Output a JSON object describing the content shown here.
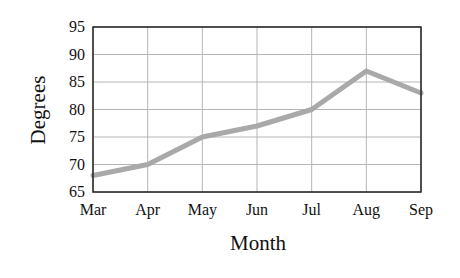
{
  "chart_data": {
    "type": "line",
    "title": "",
    "xlabel": "Month",
    "ylabel": "Degrees",
    "categories": [
      "Mar",
      "Apr",
      "May",
      "Jun",
      "Jul",
      "Aug",
      "Sep"
    ],
    "series": [
      {
        "name": "Degrees",
        "values": [
          68,
          70,
          75,
          77,
          80,
          87,
          83
        ],
        "color": "#a9a9a9"
      }
    ],
    "ylim": [
      65,
      95
    ],
    "yticks": [
      65,
      70,
      75,
      80,
      85,
      90,
      95
    ],
    "grid": true,
    "legend": "none"
  }
}
